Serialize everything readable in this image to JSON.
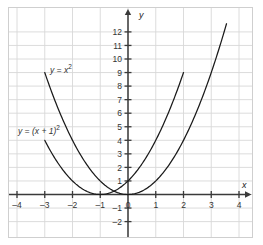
{
  "chart_data": {
    "type": "line",
    "title": "",
    "xlabel": "x",
    "ylabel": "y",
    "xlim": [
      -4.3,
      4.45
    ],
    "ylim": [
      -2.4,
      12.6
    ],
    "grid": true,
    "legend": "inline-curve-labels",
    "x_ticks": [
      -4,
      -3,
      -2,
      -1,
      0,
      1,
      2,
      3,
      4
    ],
    "x_tick_labels": [
      "-4",
      "-3",
      "-2",
      "-1",
      "0",
      "1",
      "2",
      "3",
      "4"
    ],
    "y_ticks": [
      -2,
      -1,
      1,
      2,
      3,
      4,
      5,
      6,
      7,
      8,
      9,
      10,
      11,
      12
    ],
    "y_tick_labels": [
      "-2",
      "-1",
      "1",
      "2",
      "3",
      "4",
      "5",
      "6",
      "7",
      "8",
      "9",
      "10",
      "11",
      "12"
    ],
    "series": [
      {
        "name": "y = x^2",
        "label": "y = x",
        "label_exponent": "2",
        "color": "#1a1a1a",
        "x_domain": [
          -3.0,
          3.55
        ],
        "vertex": [
          0,
          0
        ],
        "points": [
          {
            "x": -3.0,
            "y": 9.0
          },
          {
            "x": -2.5,
            "y": 6.25
          },
          {
            "x": -2.0,
            "y": 4.0
          },
          {
            "x": -1.5,
            "y": 2.25
          },
          {
            "x": -1.0,
            "y": 1.0
          },
          {
            "x": -0.5,
            "y": 0.25
          },
          {
            "x": 0.0,
            "y": 0.0
          },
          {
            "x": 0.5,
            "y": 0.25
          },
          {
            "x": 1.0,
            "y": 1.0
          },
          {
            "x": 1.5,
            "y": 2.25
          },
          {
            "x": 2.0,
            "y": 4.0
          },
          {
            "x": 2.5,
            "y": 6.25
          },
          {
            "x": 3.0,
            "y": 9.0
          },
          {
            "x": 3.55,
            "y": 12.6
          }
        ]
      },
      {
        "name": "y = (x + 1)^2",
        "label": "y = (x + 1)",
        "label_exponent": "2",
        "color": "#1a1a1a",
        "x_domain": [
          -3.0,
          2.0
        ],
        "vertex": [
          -1,
          0
        ],
        "points": [
          {
            "x": -3.0,
            "y": 4.0
          },
          {
            "x": -2.5,
            "y": 2.25
          },
          {
            "x": -2.0,
            "y": 1.0
          },
          {
            "x": -1.5,
            "y": 0.25
          },
          {
            "x": -1.0,
            "y": 0.0
          },
          {
            "x": -0.5,
            "y": 0.25
          },
          {
            "x": 0.0,
            "y": 1.0
          },
          {
            "x": 0.5,
            "y": 2.25
          },
          {
            "x": 1.0,
            "y": 4.0
          },
          {
            "x": 1.5,
            "y": 6.25
          },
          {
            "x": 2.0,
            "y": 9.0
          }
        ]
      }
    ],
    "annotations": [
      {
        "text": "y = x",
        "exponent": "2",
        "x_px": 50,
        "y_px": 63
      },
      {
        "text": "y = (x + 1)",
        "exponent": "2",
        "x_px": 18,
        "y_px": 124
      }
    ],
    "colors": {
      "grid": "#d8d8d8",
      "axis": "#3a3a3a",
      "curve": "#1a1a1a",
      "frame": "#cfcfcf",
      "background": "#ffffff",
      "text": "#333333"
    }
  },
  "axis_labels": {
    "x": "x",
    "y": "y"
  }
}
